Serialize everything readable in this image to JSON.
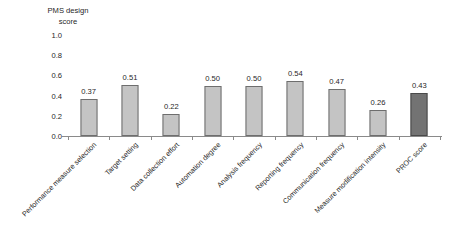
{
  "chart_data": {
    "type": "bar",
    "title": "",
    "xlabel": "",
    "ylabel": "PMS design\nscore",
    "ylim": [
      0,
      1.0
    ],
    "yticks": [
      "0.0",
      "0.2",
      "0.4",
      "0.6",
      "0.8",
      "1.0"
    ],
    "ytick_values": [
      0.0,
      0.2,
      0.4,
      0.6,
      0.8,
      1.0
    ],
    "grid": false,
    "legend": "none",
    "categories": [
      "Performance measure selection",
      "Target setting",
      "Data collection effort",
      "Automation degree",
      "Analysis frequency",
      "Reporting frequency",
      "Communication frequency",
      "Measure modification intensity",
      "PROC score"
    ],
    "values": [
      0.37,
      0.51,
      0.22,
      0.5,
      0.5,
      0.54,
      0.47,
      0.26,
      0.43
    ],
    "value_labels": [
      "0.37",
      "0.51",
      "0.22",
      "0.50",
      "0.50",
      "0.54",
      "0.47",
      "0.26",
      "0.43"
    ],
    "bar_colors": [
      "#c4c4c4",
      "#c4c4c4",
      "#c4c4c4",
      "#c4c4c4",
      "#c4c4c4",
      "#c4c4c4",
      "#c4c4c4",
      "#c4c4c4",
      "#737373"
    ],
    "highlight_index": 8,
    "bar_border_color": "#6e6e6e",
    "axis_color": "#8a8a8a",
    "background_color": "#ffffff",
    "text_color": "#1f1f1f"
  }
}
